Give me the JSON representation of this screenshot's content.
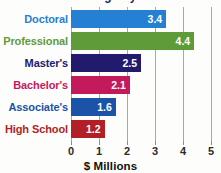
{
  "chart_data": {
    "type": "bar",
    "orientation": "horizontal",
    "title": "Lifetime earnings by education level",
    "xlabel": "$ Millions",
    "ylabel": "",
    "xlim": [
      0,
      5
    ],
    "xticks": [
      0,
      1,
      2,
      3,
      4,
      5
    ],
    "xtick_labels": [
      "0",
      "1",
      "2",
      "3",
      "4",
      "5"
    ],
    "grid": true,
    "legend": "none",
    "categories": [
      "Doctoral",
      "Professional",
      "Master's",
      "Bachelor's",
      "Associate's",
      "High School"
    ],
    "values": [
      3.4,
      4.4,
      2.5,
      2.1,
      1.6,
      1.2
    ],
    "value_labels": [
      "3.4",
      "4.4",
      "2.5",
      "2.1",
      "1.6",
      "1.2"
    ],
    "bar_colors": [
      "#2580d3",
      "#5d9c39",
      "#221a6d",
      "#c31a5c",
      "#1a53a8",
      "#b21f26"
    ],
    "label_colors": [
      "#2580d3",
      "#5d9c39",
      "#221a6d",
      "#c31a5c",
      "#1a53a8",
      "#b21f26"
    ]
  },
  "bars": [
    {
      "label": "Doctoral",
      "value": "3.4",
      "color": "#2580d3"
    },
    {
      "label": "Professional",
      "value": "4.4",
      "color": "#5d9c39"
    },
    {
      "label": "Master's",
      "value": "2.5",
      "color": "#221a6d"
    },
    {
      "label": "Bachelor's",
      "value": "2.1",
      "color": "#c31a5c"
    },
    {
      "label": "Associate's",
      "value": "1.6",
      "color": "#1a53a8"
    },
    {
      "label": "High School",
      "value": "1.2",
      "color": "#b21f26"
    }
  ],
  "axis": {
    "ticks": [
      "0",
      "1",
      "2",
      "3",
      "4",
      "5"
    ],
    "title": "$ Millions"
  },
  "colors": {
    "background": "#fdfdfc",
    "gridline": "#a8a8a8",
    "tick_text": "#2b2b2b",
    "axis_title": "#111111",
    "value_text": "#ffffff"
  }
}
